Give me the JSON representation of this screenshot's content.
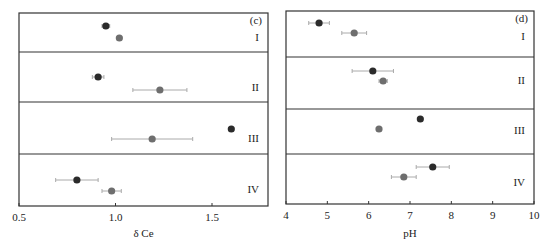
{
  "chart_data": [
    {
      "type": "scatter",
      "panel_label": "(c)",
      "xlabel": "δ Ce",
      "ylabel": "",
      "xlim": [
        0.5,
        1.75
      ],
      "xticks": [
        0.5,
        1.0,
        1.5
      ],
      "xtick_labels": [
        "0.5",
        "1.0",
        "1.5"
      ],
      "groups": [
        "I",
        "II",
        "III",
        "IV"
      ],
      "series": [
        {
          "name": "dark",
          "color": "#2b2b2b",
          "values": [
            0.95,
            0.91,
            1.6,
            0.8
          ],
          "errors": [
            0.02,
            0.03,
            0.0,
            0.11
          ]
        },
        {
          "name": "grey",
          "color": "#6e6e6e",
          "values": [
            1.02,
            1.23,
            1.19,
            0.98
          ],
          "errors": [
            0.0,
            0.14,
            0.21,
            0.05
          ]
        }
      ],
      "grid": false,
      "legend": "none"
    },
    {
      "type": "scatter",
      "panel_label": "(d)",
      "xlabel": "pH",
      "ylabel": "",
      "xlim": [
        4,
        10
      ],
      "xticks": [
        4,
        5,
        6,
        7,
        8,
        9,
        10
      ],
      "xtick_labels": [
        "4",
        "5",
        "6",
        "7",
        "8",
        "9",
        "10"
      ],
      "groups": [
        "I",
        "II",
        "III",
        "IV"
      ],
      "series": [
        {
          "name": "dark",
          "color": "#2b2b2b",
          "values": [
            4.8,
            6.1,
            7.25,
            7.55
          ],
          "errors": [
            0.25,
            0.5,
            0.0,
            0.4
          ]
        },
        {
          "name": "grey",
          "color": "#6e6e6e",
          "values": [
            5.65,
            6.35,
            6.25,
            6.85
          ],
          "errors": [
            0.3,
            0.1,
            0.0,
            0.3
          ]
        }
      ],
      "grid": false,
      "legend": "none"
    }
  ]
}
